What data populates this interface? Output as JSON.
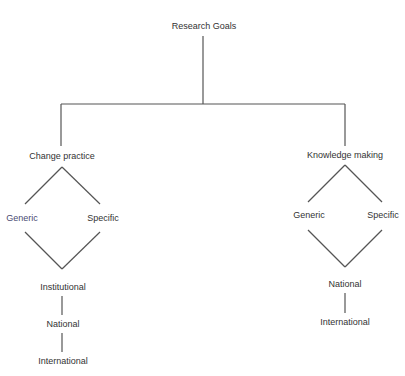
{
  "diagram": {
    "type": "tree",
    "root": {
      "label": "Research Goals"
    },
    "branches": [
      {
        "label": "Change practice",
        "options": [
          {
            "label": "Generic"
          },
          {
            "label": "Specific"
          }
        ],
        "levels": [
          {
            "label": "Institutional"
          },
          {
            "label": "National"
          },
          {
            "label": "International"
          }
        ]
      },
      {
        "label": "Knowledge making",
        "options": [
          {
            "label": "Generic"
          },
          {
            "label": "Specific"
          }
        ],
        "levels": [
          {
            "label": "National"
          },
          {
            "label": "International"
          }
        ]
      }
    ]
  },
  "colors": {
    "background": "#ffffff",
    "line": "#555555",
    "text": "#333333",
    "option_text": "#4a4a72"
  }
}
